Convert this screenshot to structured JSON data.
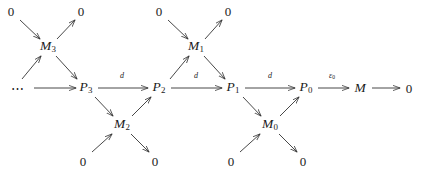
{
  "figure": {
    "kind": "commutative-diagram",
    "stroke_color": "#333333",
    "text_color": "#1a1a1a",
    "background": "#ffffff"
  },
  "nodes": [
    {
      "id": "zero-top-1",
      "label": "0",
      "sub": "",
      "x": 11,
      "y": 11,
      "style": "plain"
    },
    {
      "id": "zero-top-2",
      "label": "0",
      "sub": "",
      "x": 81,
      "y": 11,
      "style": "plain"
    },
    {
      "id": "zero-top-3",
      "label": "0",
      "sub": "",
      "x": 159,
      "y": 11,
      "style": "plain"
    },
    {
      "id": "zero-top-4",
      "label": "0",
      "sub": "",
      "x": 228,
      "y": 11,
      "style": "plain"
    },
    {
      "id": "module-m3",
      "label": "M",
      "sub": "3",
      "x": 48,
      "y": 47,
      "style": "italic"
    },
    {
      "id": "module-m1",
      "label": "M",
      "sub": "1",
      "x": 196,
      "y": 47,
      "style": "italic"
    },
    {
      "id": "ellipsis",
      "label": "⋯",
      "sub": "",
      "x": 18,
      "y": 88,
      "style": "ellipsis"
    },
    {
      "id": "proj-p3",
      "label": "P",
      "sub": "3",
      "x": 86,
      "y": 88,
      "style": "italic"
    },
    {
      "id": "proj-p2",
      "label": "P",
      "sub": "2",
      "x": 159,
      "y": 88,
      "style": "italic"
    },
    {
      "id": "proj-p1",
      "label": "P",
      "sub": "1",
      "x": 233,
      "y": 88,
      "style": "italic"
    },
    {
      "id": "proj-p0",
      "label": "P",
      "sub": "0",
      "x": 306,
      "y": 88,
      "style": "italic"
    },
    {
      "id": "module-m",
      "label": "M",
      "sub": "",
      "x": 360,
      "y": 88,
      "style": "italic"
    },
    {
      "id": "zero-end",
      "label": "0",
      "sub": "",
      "x": 409,
      "y": 88,
      "style": "plain"
    },
    {
      "id": "module-m2",
      "label": "M",
      "sub": "2",
      "x": 122,
      "y": 125,
      "style": "italic"
    },
    {
      "id": "module-m0",
      "label": "M",
      "sub": "0",
      "x": 270,
      "y": 125,
      "style": "italic"
    },
    {
      "id": "zero-bot-1",
      "label": "0",
      "sub": "",
      "x": 83,
      "y": 161,
      "style": "plain"
    },
    {
      "id": "zero-bot-2",
      "label": "0",
      "sub": "",
      "x": 155,
      "y": 161,
      "style": "plain"
    },
    {
      "id": "zero-bot-3",
      "label": "0",
      "sub": "",
      "x": 231,
      "y": 161,
      "style": "plain"
    },
    {
      "id": "zero-bot-4",
      "label": "0",
      "sub": "",
      "x": 303,
      "y": 161,
      "style": "plain"
    }
  ],
  "edge_labels": [
    {
      "id": "d-p3-p2",
      "label": "d",
      "sub": "",
      "x": 122,
      "y": 76
    },
    {
      "id": "d-p2-p1",
      "label": "d",
      "sub": "",
      "x": 196,
      "y": 76
    },
    {
      "id": "d-p1-p0",
      "label": "d",
      "sub": "",
      "x": 270,
      "y": 76
    },
    {
      "id": "epsilon-p0-m",
      "label": "ε",
      "sub": "0",
      "x": 332,
      "y": 76
    }
  ],
  "edges": [
    {
      "id": "zero-top-1-to-m3",
      "from": "zero-top-1",
      "to": "module-m3",
      "x1": 20,
      "y1": 20,
      "x2": 40,
      "y2": 39
    },
    {
      "id": "m3-to-zero-top-2",
      "from": "module-m3",
      "to": "zero-top-2",
      "x1": 57,
      "y1": 39,
      "x2": 75,
      "y2": 20
    },
    {
      "id": "p4-to-m3",
      "from": "ellipsis",
      "to": "module-m3",
      "x1": 22,
      "y1": 79,
      "x2": 41,
      "y2": 56
    },
    {
      "id": "m3-to-p3",
      "from": "module-m3",
      "to": "proj-p3",
      "x1": 56,
      "y1": 56,
      "x2": 77,
      "y2": 79
    },
    {
      "id": "ellipsis-to-p3",
      "from": "ellipsis",
      "to": "proj-p3",
      "x1": 34,
      "y1": 88,
      "x2": 76,
      "y2": 88
    },
    {
      "id": "p3-to-p2",
      "from": "proj-p3",
      "to": "proj-p2",
      "x1": 98,
      "y1": 88,
      "x2": 148,
      "y2": 88
    },
    {
      "id": "p3-to-m2",
      "from": "proj-p3",
      "to": "module-m2",
      "x1": 95,
      "y1": 97,
      "x2": 113,
      "y2": 116
    },
    {
      "id": "m2-to-p2",
      "from": "module-m2",
      "to": "proj-p2",
      "x1": 132,
      "y1": 116,
      "x2": 151,
      "y2": 97
    },
    {
      "id": "zero-bot-1-to-m2",
      "from": "zero-bot-1",
      "to": "module-m2",
      "x1": 92,
      "y1": 152,
      "x2": 112,
      "y2": 134
    },
    {
      "id": "m2-to-zero-bot-2",
      "from": "module-m2",
      "to": "zero-bot-2",
      "x1": 131,
      "y1": 134,
      "x2": 149,
      "y2": 152
    },
    {
      "id": "zero-top-3-to-m1",
      "from": "zero-top-3",
      "to": "module-m1",
      "x1": 168,
      "y1": 20,
      "x2": 188,
      "y2": 39
    },
    {
      "id": "m1-to-zero-top-4",
      "from": "module-m1",
      "to": "zero-top-4",
      "x1": 205,
      "y1": 39,
      "x2": 222,
      "y2": 20
    },
    {
      "id": "p2-to-m1",
      "from": "proj-p2",
      "to": "module-m1",
      "x1": 170,
      "y1": 79,
      "x2": 189,
      "y2": 56
    },
    {
      "id": "m1-to-p1",
      "from": "module-m1",
      "to": "proj-p1",
      "x1": 204,
      "y1": 56,
      "x2": 225,
      "y2": 79
    },
    {
      "id": "p2-to-p1",
      "from": "proj-p2",
      "to": "proj-p1",
      "x1": 171,
      "y1": 88,
      "x2": 222,
      "y2": 88
    },
    {
      "id": "p1-to-p0",
      "from": "proj-p1",
      "to": "proj-p0",
      "x1": 245,
      "y1": 88,
      "x2": 295,
      "y2": 88
    },
    {
      "id": "p1-to-m0",
      "from": "proj-p1",
      "to": "module-m0",
      "x1": 243,
      "y1": 97,
      "x2": 261,
      "y2": 116
    },
    {
      "id": "m0-to-p0",
      "from": "module-m0",
      "to": "proj-p0",
      "x1": 280,
      "y1": 116,
      "x2": 299,
      "y2": 97
    },
    {
      "id": "zero-bot-3-to-m0",
      "from": "zero-bot-3",
      "to": "module-m0",
      "x1": 240,
      "y1": 152,
      "x2": 260,
      "y2": 134
    },
    {
      "id": "m0-to-zero-bot-4",
      "from": "module-m0",
      "to": "zero-bot-4",
      "x1": 279,
      "y1": 134,
      "x2": 297,
      "y2": 152
    },
    {
      "id": "p0-to-m",
      "from": "proj-p0",
      "to": "module-m",
      "x1": 318,
      "y1": 88,
      "x2": 349,
      "y2": 88
    },
    {
      "id": "m-to-zero-end",
      "from": "module-m",
      "to": "zero-end",
      "x1": 372,
      "y1": 88,
      "x2": 400,
      "y2": 88
    }
  ]
}
